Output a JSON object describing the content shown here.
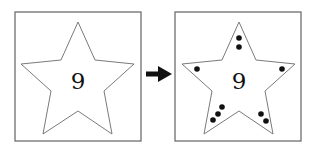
{
  "figure": {
    "left_panel": {
      "label": "9",
      "star_points": "78,22 95,60 134,64 104,91 112,134 78,111 43,134 51,91 21,64 61,60",
      "box": {
        "x": 15,
        "y": 12,
        "w": 126,
        "h": 129
      }
    },
    "arrow": {
      "direction": "right",
      "color": "#111111"
    },
    "right_panel": {
      "label": "9",
      "star_points": "239,22 256,60 295,64 265,91 273,134 239,111 204,134 212,91 182,64 222,60",
      "box": {
        "x": 175,
        "y": 12,
        "w": 126,
        "h": 129
      },
      "dot_count": 9,
      "dots": [
        {
          "cx": 239,
          "cy": 38
        },
        {
          "cx": 239,
          "cy": 47
        },
        {
          "cx": 197,
          "cy": 69
        },
        {
          "cx": 282,
          "cy": 69
        },
        {
          "cx": 222,
          "cy": 107
        },
        {
          "cx": 218,
          "cy": 114
        },
        {
          "cx": 213,
          "cy": 120
        },
        {
          "cx": 261,
          "cy": 114
        },
        {
          "cx": 266,
          "cy": 121
        }
      ]
    }
  }
}
